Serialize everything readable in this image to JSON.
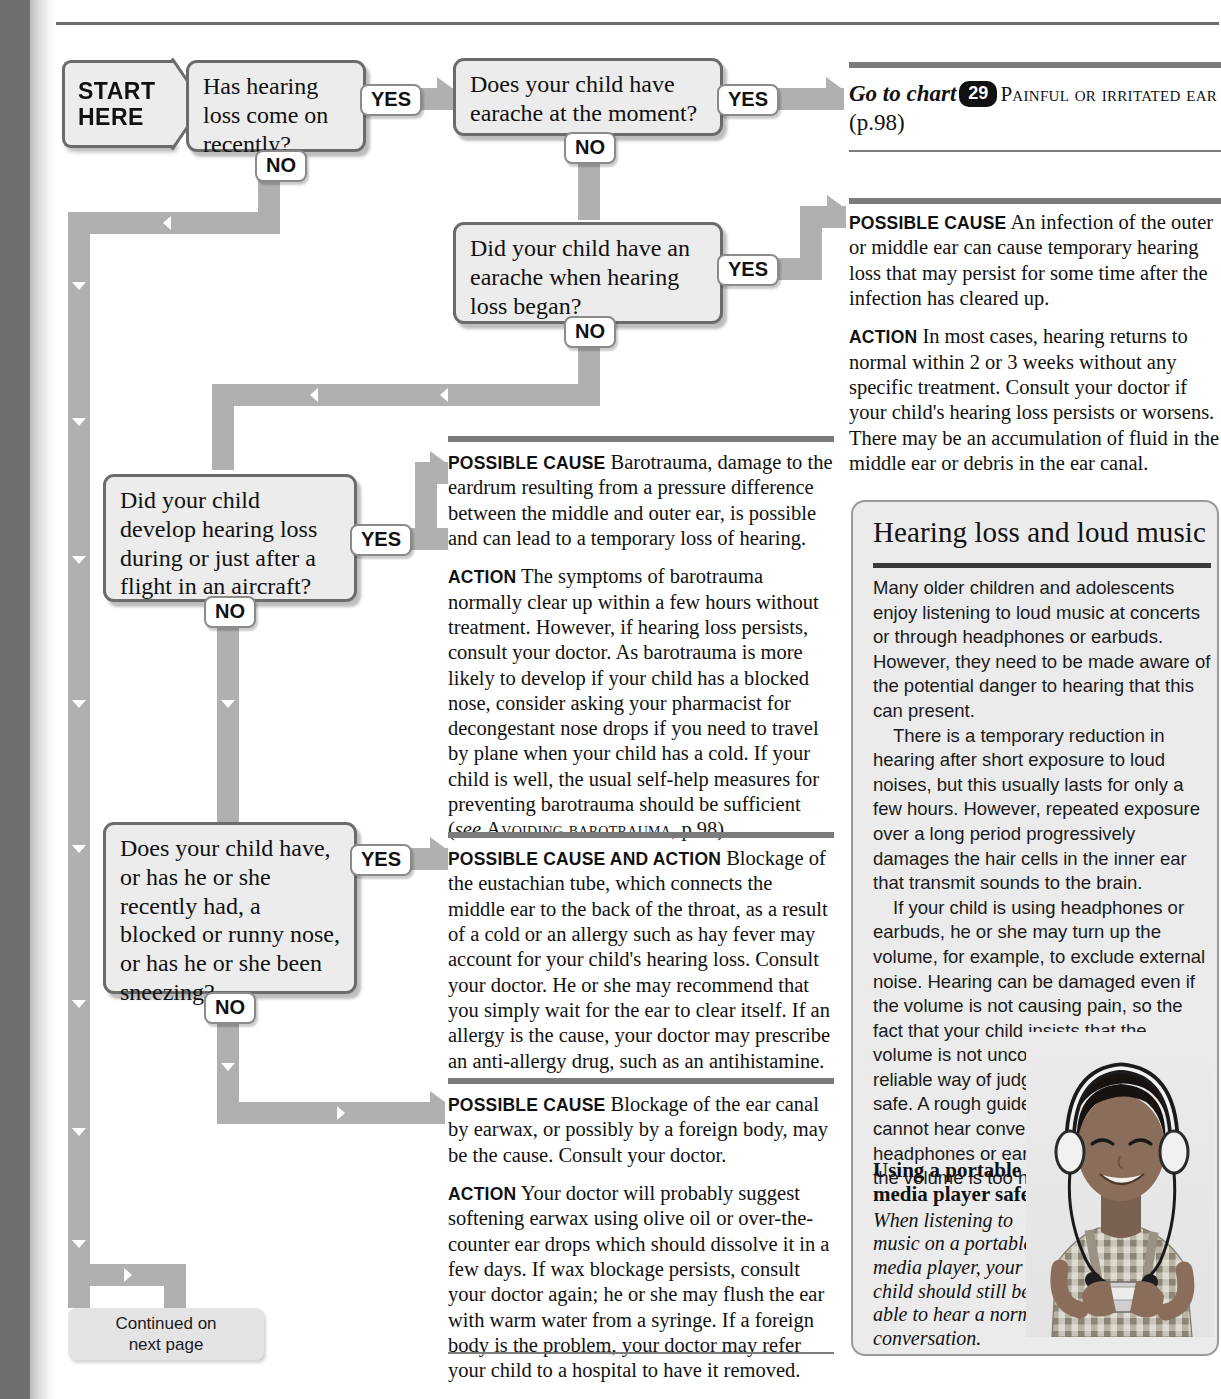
{
  "flowchart": {
    "start": {
      "line1": "START",
      "line2": "HERE"
    },
    "questions": [
      {
        "id": "q1",
        "text": "Has hearing loss come on recently?"
      },
      {
        "id": "q2",
        "text": "Does your child have earache at the moment?"
      },
      {
        "id": "q3",
        "text": "Did your child have an earache when hearing loss began?"
      },
      {
        "id": "q4",
        "text": "Did your child develop hearing loss during or just after a flight in an aircraft?"
      },
      {
        "id": "q5",
        "text": "Does your child have, or has he or she recently had, a blocked or runny nose, or has he or she been sneezing?"
      }
    ],
    "badges": {
      "yes": "YES",
      "no": "NO"
    },
    "continued": {
      "line1": "Continued on",
      "line2": "next page"
    }
  },
  "goto_chart": {
    "prefix": "Go to chart",
    "number": "29",
    "title": "Painful or irritated ear",
    "page": "(p.98)"
  },
  "advice": [
    {
      "id": "ear-infection",
      "blocks": [
        {
          "lead": "Possible cause",
          "text": "An infection of the outer or middle ear can cause temporary hearing loss that may persist for some time after the infection has cleared up."
        },
        {
          "lead": "Action",
          "text": "In most cases, hearing returns to normal within 2 or 3 weeks without any specific treatment. Consult your doctor if your child's hearing loss persists or worsens. There may be an accumulation of fluid in the middle ear or debris in the ear canal."
        }
      ]
    },
    {
      "id": "barotrauma",
      "blocks": [
        {
          "lead": "Possible cause",
          "text": "Barotrauma, damage to the eardrum resulting from a pressure difference between the middle and outer ear, is possible and can lead to a temporary loss of hearing."
        },
        {
          "lead": "Action",
          "text": "The symptoms of barotrauma normally clear up within a few hours without treatment. However, if hearing loss persists, consult your doctor. As barotrauma is more likely to develop if your child has a blocked nose, consider asking your pharmacist for decongestant nose drops if you need to travel by plane when your child has a cold. If your child is well, the usual self-help measures for preventing barotrauma should be sufficient ",
          "ref_see": "see",
          "ref_title": "Avoiding barotrauma",
          "ref_page": "p.98"
        }
      ]
    },
    {
      "id": "eustachian-tube",
      "blocks": [
        {
          "lead": "Possible cause and action",
          "text": "Blockage of the eustachian tube, which connects the middle ear to the back of the throat, as a result of a cold or an allergy such as hay fever may account for your child's hearing loss. Consult your doctor. He or she may recommend that you simply wait for the ear to clear itself. If an allergy is the cause, your doctor may prescribe an anti-allergy drug, such as an antihistamine."
        }
      ]
    },
    {
      "id": "earwax",
      "blocks": [
        {
          "lead": "Possible cause",
          "text": "Blockage of the ear canal by earwax, or possibly by a foreign body, may be the cause. Consult your doctor."
        },
        {
          "lead": "Action",
          "text": "Your doctor will probably suggest softening earwax using olive oil or over-the-counter ear drops which should dissolve it in a few days. If wax blockage persists, consult your doctor again; he or she may flush the ear with warm water from a syringe. If a foreign body is the problem, your doctor may refer your child to a hospital to have it removed."
        }
      ]
    }
  ],
  "sidebar": {
    "title": "Hearing loss and loud music",
    "paragraphs": [
      "Many older children and adolescents enjoy listening to loud music at concerts or through headphones or earbuds. However, they need to be made aware of the potential danger to hearing that this can present.",
      "There is a temporary reduction in hearing after short exposure to loud noises, but this usually lasts for only a few hours. However, repeated exposure over a long period progressively damages the hair cells in the inner ear that transmit sounds to the brain.",
      "If your child is using headphones or earbuds, he or she may turn up the volume, for example, to exclude external noise. Hearing can be damaged even if the volume is not causing pain, so the fact that your child insists that the volume is not uncomfortably high is not a reliable way of judging that the level is safe. A rough guide is that if your child cannot hear conversation while using headphones or earbuds, it is likely that the volume is too high."
    ],
    "caption": {
      "title": "Using a portable media player safely",
      "body": "When listening to music on a portable media player, your child should still be able to hear a normal conversation."
    }
  },
  "colors": {
    "spine": "#6f6f6f",
    "pipe": "#b0b0b0",
    "box_fill": "#ececec",
    "box_border": "#6b6b6b",
    "rule": "#7b7b7b",
    "sidebar_fill": "#ebebeb"
  }
}
